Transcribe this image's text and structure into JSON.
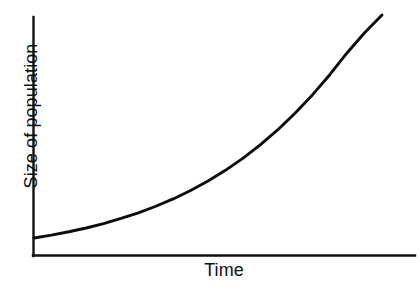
{
  "chart_data": {
    "type": "line",
    "title": "",
    "subtitle": "",
    "xlabel": "Time",
    "ylabel": "Size of population",
    "legend": [],
    "grid": false,
    "axis_ticks": {
      "x": [],
      "y": []
    },
    "xlim": [
      0,
      1
    ],
    "ylim": [
      0,
      1
    ],
    "annotations": [],
    "series": [
      {
        "name": "Population size",
        "color": "#0d0d0d",
        "x": [
          0.0,
          0.05,
          0.1,
          0.15,
          0.2,
          0.25,
          0.3,
          0.35,
          0.4,
          0.45,
          0.5,
          0.55,
          0.6,
          0.65,
          0.7,
          0.75,
          0.8,
          0.85,
          0.9,
          0.95,
          1.0
        ],
        "y": [
          0.075,
          0.088,
          0.103,
          0.12,
          0.14,
          0.163,
          0.188,
          0.218,
          0.251,
          0.289,
          0.332,
          0.38,
          0.434,
          0.495,
          0.562,
          0.637,
          0.72,
          0.811,
          0.91,
          1.0,
          1.08
        ]
      }
    ]
  },
  "axes": {
    "y_axis_name": "y-axis",
    "x_axis_name": "x-axis"
  },
  "labels": {
    "y": "Size of population",
    "x": "Time"
  },
  "colors": {
    "background": "#ffffff",
    "axis": "#111111",
    "curve": "#0d0d0d"
  }
}
